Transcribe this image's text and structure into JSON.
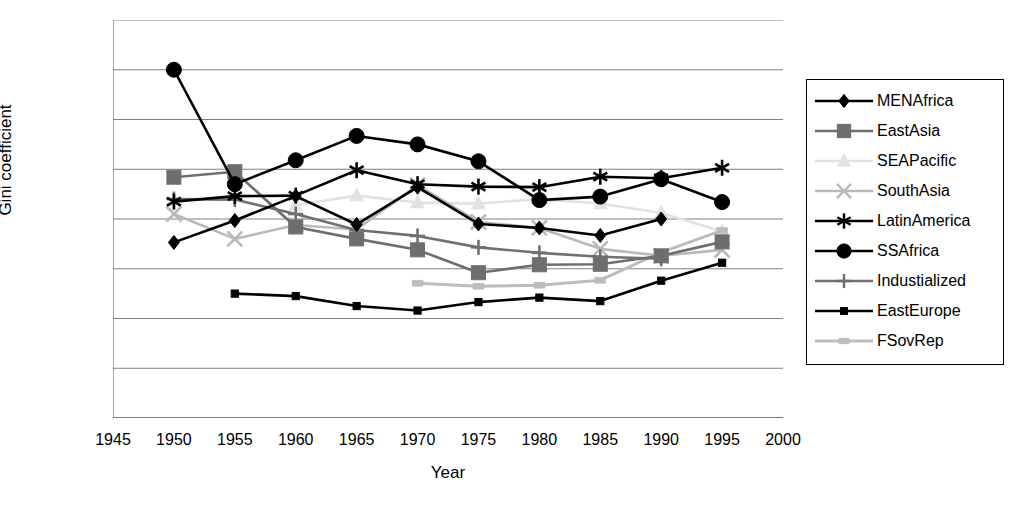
{
  "chart_data": {
    "type": "line",
    "title": "",
    "xlabel": "Year",
    "ylabel": "Gini coefficient",
    "xlim": [
      1945,
      2000
    ],
    "ylim": [
      0,
      80
    ],
    "xticks": [
      1945,
      1950,
      1955,
      1960,
      1965,
      1970,
      1975,
      1980,
      1985,
      1990,
      1995,
      2000
    ],
    "yticks": [
      0,
      10,
      20,
      30,
      40,
      50,
      60,
      70,
      80
    ],
    "grid": "horizontal",
    "legend_position": "right",
    "x": [
      1950,
      1955,
      1960,
      1965,
      1970,
      1975,
      1980,
      1985,
      1990,
      1995
    ],
    "series": [
      {
        "name": "MENAfrica",
        "marker": "diamond",
        "color": "#000000",
        "values": [
          35.3,
          39.7,
          44.6,
          38.9,
          46.4,
          39.0,
          38.2,
          36.7,
          40.0,
          null
        ]
      },
      {
        "name": "EastAsia",
        "marker": "square",
        "color": "#6e6e6e",
        "values": [
          48.4,
          49.5,
          38.4,
          36.0,
          33.8,
          29.2,
          30.8,
          30.9,
          32.6,
          35.4
        ]
      },
      {
        "name": "SEAPacific",
        "marker": "triangle",
        "color": "#e2e2e2",
        "values": [
          null,
          null,
          42.8,
          44.7,
          43.3,
          43.1,
          44.0,
          43.1,
          41.2,
          37.5
        ]
      },
      {
        "name": "SouthAsia",
        "marker": "x",
        "color": "#b9b9b9",
        "values": [
          41.0,
          36.0,
          38.8,
          37.9,
          46.8,
          39.4,
          38.2,
          34.0,
          32.6,
          33.8
        ]
      },
      {
        "name": "LatinAmerica",
        "marker": "asterisk",
        "color": "#000000",
        "values": [
          43.5,
          44.6,
          44.7,
          49.8,
          47.0,
          46.5,
          46.4,
          48.5,
          48.2,
          50.3
        ]
      },
      {
        "name": "SSAfrica",
        "marker": "circle",
        "color": "#000000",
        "values": [
          70.0,
          47.0,
          51.8,
          56.7,
          55.0,
          51.6,
          43.8,
          44.5,
          48.0,
          43.4
        ]
      },
      {
        "name": "Industialized",
        "marker": "plus",
        "color": "#707070",
        "values": [
          44.0,
          43.9,
          41.0,
          37.8,
          36.6,
          34.3,
          33.2,
          32.4,
          32.0,
          null
        ]
      },
      {
        "name": "EastEurope",
        "marker": "smallsquare",
        "color": "#000000",
        "values": [
          null,
          25.0,
          24.5,
          22.5,
          21.6,
          23.3,
          24.2,
          23.5,
          27.6,
          31.2
        ]
      },
      {
        "name": "FSovRep",
        "marker": "dotted",
        "color": "#bcbcbc",
        "values": [
          null,
          null,
          null,
          null,
          27.1,
          26.5,
          26.7,
          27.7,
          33.3,
          37.7
        ]
      }
    ]
  },
  "legend": {
    "items": [
      {
        "label": "MENAfrica"
      },
      {
        "label": "EastAsia"
      },
      {
        "label": "SEAPacific"
      },
      {
        "label": "SouthAsia"
      },
      {
        "label": "LatinAmerica"
      },
      {
        "label": "SSAfrica"
      },
      {
        "label": "Industialized"
      },
      {
        "label": "EastEurope"
      },
      {
        "label": "FSovRep"
      }
    ]
  }
}
